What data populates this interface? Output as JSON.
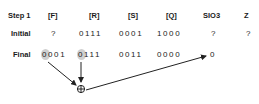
{
  "headers": {
    "step": "Step 1",
    "f": "[F]",
    "r": "[R]",
    "s": "[S]",
    "q": "[Q]",
    "sio3": "SIO3",
    "z": "Z"
  },
  "rows": {
    "initial": {
      "label": "Initial",
      "f": "?",
      "r": "0111",
      "s": "0001",
      "q": "1000",
      "sio3": "?",
      "z": "?"
    },
    "final": {
      "label": "Final",
      "f": "0001",
      "r": "0111",
      "s": "0011",
      "q": "0000",
      "sio3": "0"
    }
  },
  "operator": {
    "symbol": "⊕",
    "name": "xor"
  },
  "colors": {
    "text": "#1a1a1a",
    "highlight": "#cfcfcf",
    "arrow": "#222222"
  }
}
